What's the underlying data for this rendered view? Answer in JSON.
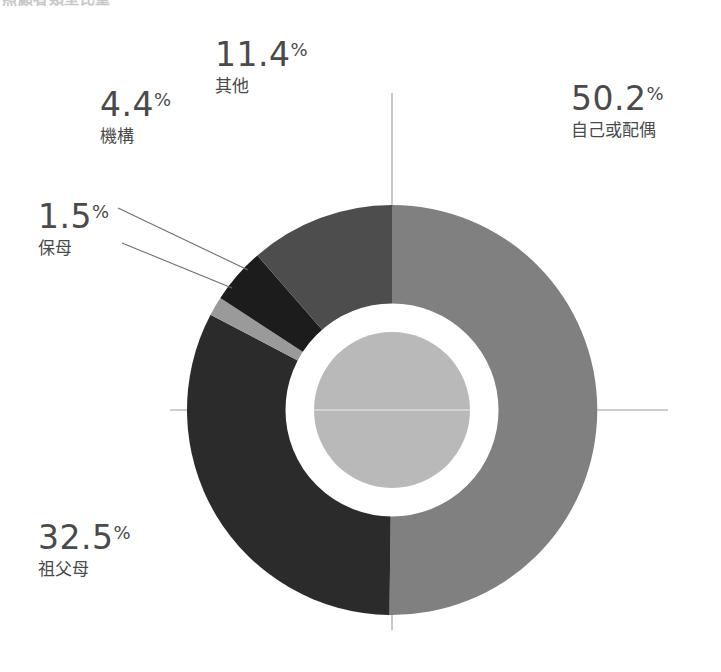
{
  "title_fragment": "照顧者類型比重",
  "chart_data": {
    "type": "pie",
    "variant": "donut",
    "title": "照顧者類型比重",
    "xlabel": "",
    "ylabel": "",
    "grid": false,
    "legend_position": "callout-labels",
    "value_unit": "%",
    "total": 100.0,
    "start_angle_deg": 0,
    "direction": "clockwise",
    "center": {
      "x": 392,
      "y": 410
    },
    "outer_radius": 205,
    "ring_gap_radius": 97,
    "inner_radius": 78,
    "categories": [
      "自己或配偶",
      "祖父母",
      "保母",
      "機構",
      "其他"
    ],
    "values": [
      50.2,
      32.5,
      1.5,
      4.4,
      11.4
    ],
    "colors": [
      "#808080",
      "#2b2b2b",
      "#9a9a9a",
      "#1c1c1c",
      "#4d4d4d"
    ],
    "slices": [
      {
        "label": "自己或配偶",
        "value": 50.2,
        "value_text": "50.2",
        "percent_sign": "%",
        "color": "#808080",
        "start_angle_deg": 0,
        "end_angle_deg": 180.72
      },
      {
        "label": "祖父母",
        "value": 32.5,
        "value_text": "32.5",
        "percent_sign": "%",
        "color": "#2b2b2b",
        "start_angle_deg": 180.72,
        "end_angle_deg": 297.72
      },
      {
        "label": "保母",
        "value": 1.5,
        "value_text": "1.5",
        "percent_sign": "%",
        "color": "#9a9a9a",
        "start_angle_deg": 297.72,
        "end_angle_deg": 303.12
      },
      {
        "label": "機構",
        "value": 4.4,
        "value_text": "4.4",
        "percent_sign": "%",
        "color": "#1c1c1c",
        "start_angle_deg": 303.12,
        "end_angle_deg": 318.96
      },
      {
        "label": "其他",
        "value": 11.4,
        "value_text": "11.4",
        "percent_sign": "%",
        "color": "#4d4d4d",
        "start_angle_deg": 318.96,
        "end_angle_deg": 360.0
      }
    ],
    "hole_fill_color": "#b9b9b9",
    "ring_color": "#ffffff",
    "crosshair_color": "#9a9a9a",
    "leader_line_color": "#6f6f6f",
    "background_color": "#ffffff",
    "label_text_color": "#4a4a4a"
  }
}
